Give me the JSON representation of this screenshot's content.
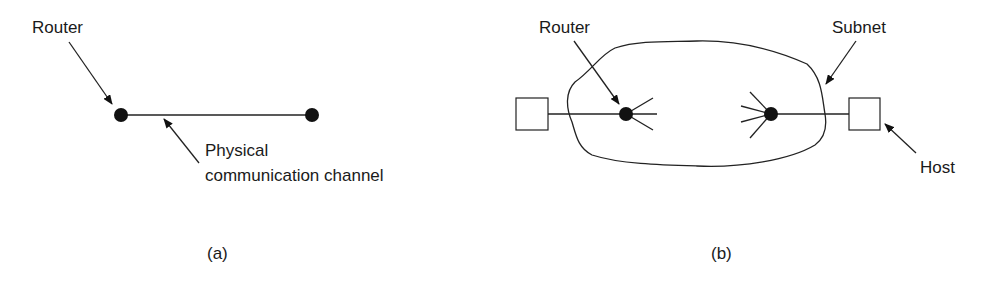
{
  "diagram_a": {
    "router_label": "Router",
    "channel_label_line1": "Physical",
    "channel_label_line2": "communication channel",
    "caption": "(a)"
  },
  "diagram_b": {
    "router_label": "Router",
    "subnet_label": "Subnet",
    "host_label": "Host",
    "caption": "(b)"
  },
  "colors": {
    "ink": "#1a1a1a",
    "background": "#ffffff"
  }
}
